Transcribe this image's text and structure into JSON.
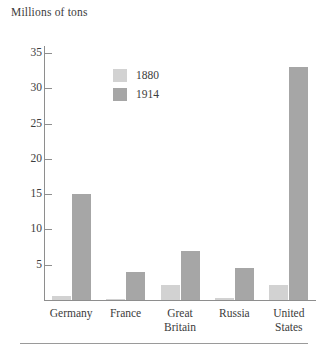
{
  "chart_data": {
    "type": "bar",
    "title": "",
    "ylabel": "Millions of tons",
    "xlabel": "",
    "ylim": [
      0,
      36
    ],
    "yticks": [
      5,
      10,
      15,
      20,
      25,
      30,
      35
    ],
    "ytick_labels": [
      "5",
      "10",
      "15",
      "20",
      "25",
      "30",
      "35"
    ],
    "grid": false,
    "legend_position": "inside-top-left",
    "categories": [
      "Germany",
      "France",
      "Great Britain",
      "Russia",
      "United States"
    ],
    "category_label_lines": [
      [
        "Germany"
      ],
      [
        "France"
      ],
      [
        "Great",
        "Britain"
      ],
      [
        "Russia"
      ],
      [
        "United",
        "States"
      ]
    ],
    "series": [
      {
        "name": "1880",
        "color": "#d2d2d2",
        "values": [
          0.5,
          0.2,
          2.1,
          0.3,
          2.1
        ]
      },
      {
        "name": "1914",
        "color": "#a6a6a6",
        "values": [
          15.0,
          4.0,
          7.0,
          4.6,
          33.0
        ]
      }
    ]
  },
  "legend": {
    "entries": [
      {
        "label": "1880",
        "color": "#d2d2d2"
      },
      {
        "label": "1914",
        "color": "#a6a6a6"
      }
    ]
  },
  "axis": {
    "y_title": "Millions of tons",
    "axis_color": "#8e8e8e"
  }
}
